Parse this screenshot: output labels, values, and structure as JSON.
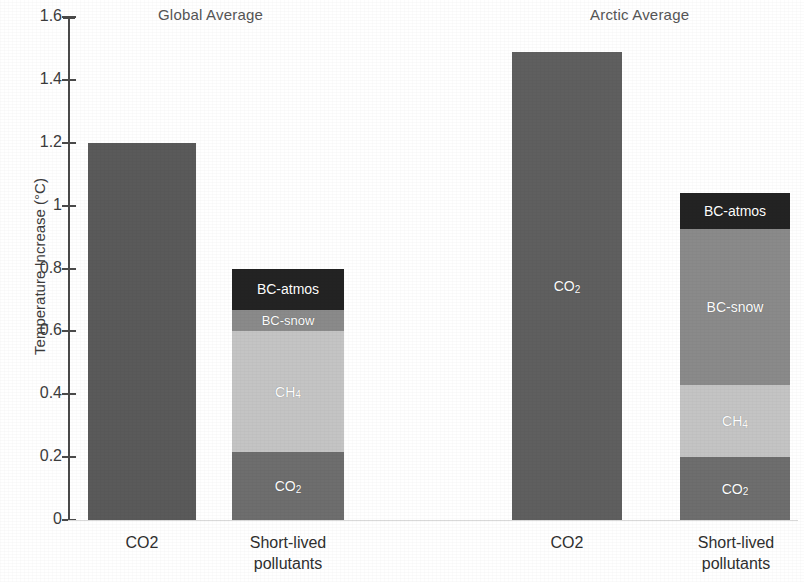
{
  "chart_data": {
    "type": "bar",
    "title": "",
    "subtitle": "",
    "xlabel": "",
    "ylabel": "Temperature Increase (°C)",
    "ylim": [
      0,
      1.6
    ],
    "yticks": [
      0,
      0.2,
      0.4,
      0.6,
      0.8,
      1,
      1.2,
      1.4,
      1.6
    ],
    "ytick_labels": [
      "0",
      "0.2",
      "0.4",
      "0.6",
      "0.8",
      "1",
      "1.2",
      "1.4",
      "1.6"
    ],
    "grid": false,
    "legend": "none (in-bar labels)",
    "stacked": true,
    "group_titles": [
      "Global Average",
      "Arctic Average"
    ],
    "categories": [
      "CO2",
      "Short-lived pollutants"
    ],
    "groups": [
      {
        "name": "Global Average",
        "bars": [
          {
            "category": "CO2",
            "total": 1.2,
            "segments": [
              {
                "name": "CO2",
                "label": "",
                "value": 1.2,
                "color": "#5a5a5a"
              }
            ]
          },
          {
            "category": "Short-lived pollutants",
            "total": 0.8,
            "segments": [
              {
                "name": "CO2",
                "label": "CO₂",
                "value": 0.217,
                "color": "#6e6e6e"
              },
              {
                "name": "CH4",
                "label": "CH₄",
                "value": 0.383,
                "color": "#c4c4c4"
              },
              {
                "name": "BC-snow",
                "label": "BC-snow",
                "value": 0.067,
                "color": "#8a8a8a"
              },
              {
                "name": "BC-atmos",
                "label": "BC-atmos",
                "value": 0.133,
                "color": "#232323"
              }
            ]
          }
        ]
      },
      {
        "name": "Arctic Average",
        "bars": [
          {
            "category": "CO2",
            "total": 1.49,
            "segments": [
              {
                "name": "CO2",
                "label": "CO₂",
                "value": 1.49,
                "color": "#5f5f5f"
              }
            ]
          },
          {
            "category": "Short-lived pollutants",
            "total": 1.04,
            "segments": [
              {
                "name": "CO2",
                "label": "CO₂",
                "value": 0.2,
                "color": "#6e6e6e"
              },
              {
                "name": "CH4",
                "label": "CH₄",
                "value": 0.23,
                "color": "#c4c4c4"
              },
              {
                "name": "BC-snow",
                "label": "BC-snow",
                "value": 0.495,
                "color": "#8a8a8a"
              },
              {
                "name": "BC-atmos",
                "label": "BC-atmos",
                "value": 0.115,
                "color": "#232323"
              }
            ]
          }
        ]
      }
    ]
  },
  "axes": {
    "y_title": "Temperature Increase (°C)",
    "tick_labels": [
      "1.6",
      "1.4",
      "1.2",
      "1",
      "0.8",
      "0.6",
      "0.4",
      "0.2",
      "0"
    ]
  },
  "titles": {
    "global": "Global Average",
    "arctic": "Arctic Average"
  },
  "x_labels": {
    "global_co2": "CO2",
    "global_slcp": "Short-lived\npollutants",
    "arctic_co2": "CO2",
    "arctic_slcp": "Short-lived\npollutants"
  },
  "colors": {
    "co2_solid": "#5a5a5a",
    "co2_stack": "#6e6e6e",
    "ch4": "#c4c4c4",
    "bc_snow": "#8a8a8a",
    "bc_atmos": "#232323",
    "axis": "#4a4a4a",
    "text": "#3c3c3c"
  }
}
